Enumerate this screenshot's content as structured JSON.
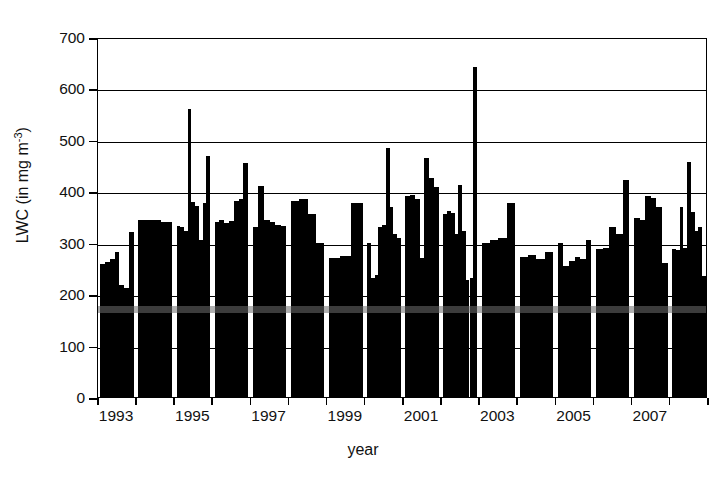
{
  "chart_data": {
    "type": "bar",
    "title": "",
    "xlabel": "year",
    "ylabel_text": "LWC (in mg m",
    "ylabel_sup": "-3",
    "ylabel_tail": ")",
    "ylabel_full": "LWC (in mg m-3)",
    "ylim": [
      0,
      700
    ],
    "ytick_values": [
      0,
      100,
      200,
      300,
      400,
      500,
      600,
      700
    ],
    "xlim": [
      1993,
      2009
    ],
    "xtick_labels": [
      "1993",
      "1995",
      "1997",
      "1999",
      "2001",
      "2003",
      "2005",
      "2007"
    ],
    "xtick_label_years": [
      1993,
      1995,
      1997,
      1999,
      2001,
      2003,
      2005,
      2007
    ],
    "xtick_all_years": [
      1993,
      1994,
      1995,
      1996,
      1997,
      1998,
      1999,
      2000,
      2001,
      2002,
      2003,
      2004,
      2005,
      2006,
      2007,
      2008,
      2009
    ],
    "grid": "horizontal",
    "legend": "none",
    "bar_color": "#000000",
    "mean_band_value": 175,
    "mean_band_color": "#6e6e6e",
    "axis_color": "#000000",
    "note": "Each year contains several narrow bars (individual measurement campaigns); values read off the y-axis in mg m-3.",
    "groups": [
      {
        "year": 1993,
        "values": [
          258,
          262,
          268,
          282,
          218,
          212,
          320
        ]
      },
      {
        "year": 1994,
        "values": [
          345,
          344,
          341
        ]
      },
      {
        "year": 1995,
        "values": [
          333,
          330,
          322,
          560,
          380,
          372,
          305,
          378,
          468
        ]
      },
      {
        "year": 1996,
        "values": [
          341,
          345,
          338,
          342,
          382,
          386,
          455
        ]
      },
      {
        "year": 1997,
        "values": [
          330,
          410,
          345,
          340,
          335,
          332
        ]
      },
      {
        "year": 1998,
        "values": [
          382,
          386,
          355,
          300
        ]
      },
      {
        "year": 1999,
        "values": [
          270,
          275,
          378
        ]
      },
      {
        "year": 2000,
        "values": [
          300,
          232,
          238,
          330,
          335,
          484,
          370,
          318,
          310
        ]
      },
      {
        "year": 2001,
        "values": [
          390,
          392,
          386,
          270,
          465,
          425,
          408
        ]
      },
      {
        "year": 2002,
        "values": [
          355,
          362,
          358,
          318,
          412,
          322,
          228,
          232,
          642
        ]
      },
      {
        "year": 2003,
        "values": [
          300,
          305,
          310,
          378
        ]
      },
      {
        "year": 2004,
        "values": [
          272,
          276,
          268,
          282
        ]
      },
      {
        "year": 2005,
        "values": [
          300,
          255,
          265,
          272,
          268,
          305
        ]
      },
      {
        "year": 2006,
        "values": [
          288,
          290,
          330,
          318,
          422
        ]
      },
      {
        "year": 2007,
        "values": [
          348,
          345,
          390,
          388,
          370,
          260
        ]
      },
      {
        "year": 2008,
        "values": [
          288,
          285,
          370,
          290,
          458,
          360,
          322,
          330,
          235
        ]
      }
    ]
  }
}
